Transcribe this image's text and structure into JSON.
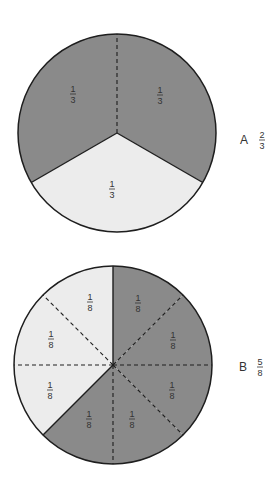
{
  "colors": {
    "shaded": "#8a8a8a",
    "unshaded": "#ececec",
    "outline": "#1e1e1e",
    "text": "#333333",
    "background": "#ffffff"
  },
  "diagrams": [
    {
      "id": "A",
      "label": "A",
      "fraction": {
        "numerator": "2",
        "denominator": "3"
      },
      "center": [
        117,
        133
      ],
      "radius": 99,
      "total_parts": 3,
      "shaded_parts": 2,
      "sectors": [
        {
          "start_deg": 90,
          "end_deg": 210,
          "shaded": true,
          "label": {
            "num": "1",
            "den": "3",
            "x": 73,
            "y": 94
          }
        },
        {
          "start_deg": -30,
          "end_deg": 90,
          "shaded": true,
          "label": {
            "num": "1",
            "den": "3",
            "x": 160,
            "y": 95
          }
        },
        {
          "start_deg": 210,
          "end_deg": 330,
          "shaded": false,
          "label": {
            "num": "1",
            "den": "3",
            "x": 112,
            "y": 189
          }
        }
      ],
      "solid_lines_deg": [
        210,
        330
      ],
      "dashed_lines_deg": [
        90
      ],
      "caption_pos": {
        "letter_x": 244,
        "frac_x": 262,
        "y": 140
      }
    },
    {
      "id": "B",
      "label": "B",
      "fraction": {
        "numerator": "5",
        "denominator": "8"
      },
      "center": [
        113,
        365
      ],
      "radius": 99,
      "total_parts": 8,
      "shaded_parts": 5,
      "sectors": [
        {
          "start_deg": 45,
          "end_deg": 90,
          "shaded": true,
          "label": {
            "num": "1",
            "den": "8",
            "x": 138,
            "y": 303
          }
        },
        {
          "start_deg": 0,
          "end_deg": 45,
          "shaded": true,
          "label": {
            "num": "1",
            "den": "8",
            "x": 173,
            "y": 340
          }
        },
        {
          "start_deg": -45,
          "end_deg": 0,
          "shaded": true,
          "label": {
            "num": "1",
            "den": "8",
            "x": 172,
            "y": 390
          }
        },
        {
          "start_deg": -90,
          "end_deg": -45,
          "shaded": true,
          "label": {
            "num": "1",
            "den": "8",
            "x": 132,
            "y": 419
          }
        },
        {
          "start_deg": 225,
          "end_deg": 270,
          "shaded": true,
          "label": {
            "num": "1",
            "den": "8",
            "x": 89,
            "y": 419
          }
        },
        {
          "start_deg": 180,
          "end_deg": 225,
          "shaded": false,
          "label": {
            "num": "1",
            "den": "8",
            "x": 50,
            "y": 390
          }
        },
        {
          "start_deg": 135,
          "end_deg": 180,
          "shaded": false,
          "label": {
            "num": "1",
            "den": "8",
            "x": 51,
            "y": 339
          }
        },
        {
          "start_deg": 90,
          "end_deg": 135,
          "shaded": false,
          "label": {
            "num": "1",
            "den": "8",
            "x": 90,
            "y": 302
          }
        }
      ],
      "solid_lines_deg": [
        90,
        225
      ],
      "dashed_lines_deg": [
        45,
        0,
        -45,
        270,
        180,
        135
      ],
      "caption_pos": {
        "letter_x": 243,
        "frac_x": 260,
        "y": 367
      }
    }
  ]
}
